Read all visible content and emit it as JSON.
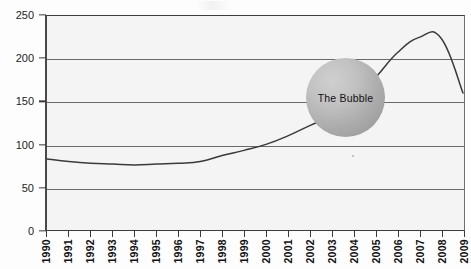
{
  "chart_data": {
    "type": "line",
    "title": "",
    "subtitle": "",
    "xlabel": "",
    "ylabel": "",
    "categories": [
      "1990",
      "1991",
      "1992",
      "1993",
      "1994",
      "1995",
      "1996",
      "1997",
      "1998",
      "1999",
      "2000",
      "2001",
      "2002",
      "2003",
      "2004",
      "2005",
      "2006",
      "2007",
      "2008",
      "2009"
    ],
    "values": [
      83,
      80,
      78,
      77,
      76,
      77,
      78,
      80,
      87,
      93,
      100,
      110,
      122,
      133,
      152,
      178,
      207,
      225,
      224,
      200
    ],
    "series": [
      {
        "name": "Index",
        "values": [
          83,
          80,
          78,
          77,
          76,
          77,
          78,
          80,
          87,
          93,
          100,
          110,
          122,
          133,
          152,
          178,
          207,
          225,
          224,
          200
        ]
      }
    ],
    "end_value": 160,
    "ylim": [
      0,
      250
    ],
    "xlim": [
      "1990",
      "2009"
    ],
    "y_ticks": [
      0,
      50,
      100,
      150,
      200,
      250
    ],
    "grid": true,
    "gridline_values": [
      50,
      100,
      150,
      200
    ],
    "legend": "none",
    "line_color": "#3a3a3a",
    "plot_background": "#f4f4f4"
  },
  "annotations": {
    "bubble": {
      "label": "The Bubble",
      "shape": "circle",
      "fill_color": "#ababab",
      "text_color": "#111111"
    }
  },
  "axis": {
    "y_tick_labels": [
      "250",
      "200",
      "150",
      "100",
      "50",
      "0"
    ],
    "x_tick_labels": [
      "1990",
      "1991",
      "1992",
      "1993",
      "1994",
      "1995",
      "1996",
      "1997",
      "1998",
      "1999",
      "2000",
      "2001",
      "2002",
      "2003",
      "2004",
      "2005",
      "2006",
      "2007",
      "2008",
      "2009"
    ]
  },
  "bleed_through": {
    "line_a": "Housing Bubble",
    "line_b": "the reverse side of the page",
    "line_c": "faint show-through text",
    "line_d": "scanned print artifact"
  }
}
